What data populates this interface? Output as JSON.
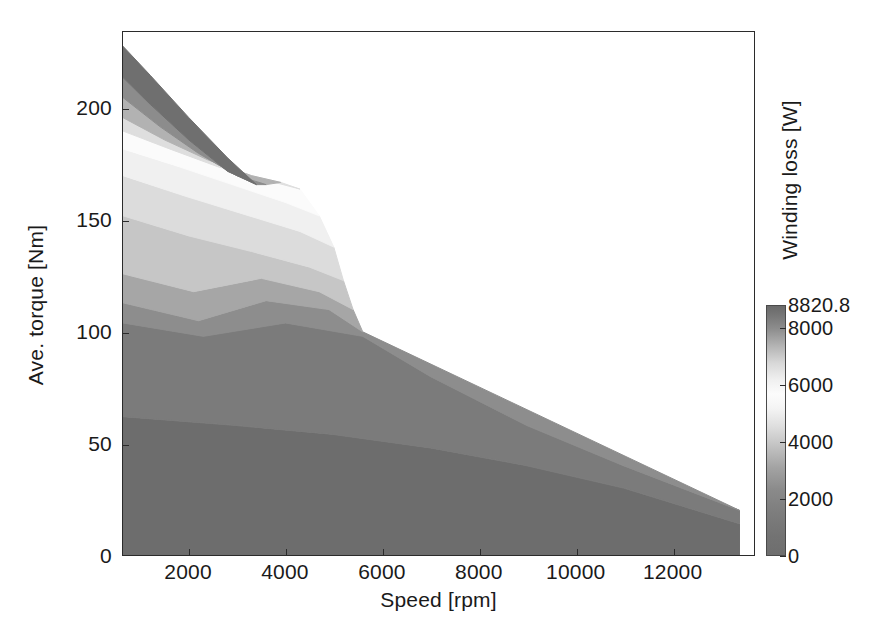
{
  "figure": {
    "background": "#ffffff",
    "plot_bg": "#ffffff",
    "frame_color": "#2b2b2b"
  },
  "axes": {
    "xlabel": "Speed [rpm]",
    "ylabel": "Ave. torque [Nm]",
    "xticks": [
      2000,
      4000,
      6000,
      8000,
      10000,
      12000
    ],
    "xtick_labels": [
      "2000",
      "4000",
      "6000",
      "8000",
      "10000",
      "12000"
    ],
    "yticks": [
      0,
      50,
      100,
      150,
      200
    ],
    "ytick_labels": [
      "0",
      "50",
      "100",
      "150",
      "200"
    ],
    "xlim": [
      636,
      13700
    ],
    "ylim": [
      0,
      234.4
    ],
    "grid": false
  },
  "colorbar": {
    "label": "Winding loss [W]",
    "ticks": [
      8820.8,
      8000,
      6000,
      4000,
      2000,
      0
    ],
    "tick_labels": [
      "8820.8",
      "8000",
      "6000",
      "4000",
      "2000",
      "0"
    ],
    "vmin": 0,
    "vmax": 8820.8,
    "orientation": "vertical",
    "position": "right",
    "colormap_stops": [
      {
        "value": 0,
        "color": "#6e6e6e"
      },
      {
        "value": 700,
        "color": "#737373"
      },
      {
        "value": 1500,
        "color": "#7d7d7d"
      },
      {
        "value": 2300,
        "color": "#8a8a8a"
      },
      {
        "value": 3100,
        "color": "#a3a3a3"
      },
      {
        "value": 3900,
        "color": "#c4c4c4"
      },
      {
        "value": 4600,
        "color": "#e0e0e0"
      },
      {
        "value": 5200,
        "color": "#f4f4f4"
      },
      {
        "value": 5700,
        "color": "#fcfcfc"
      },
      {
        "value": 6200,
        "color": "#f0f0f0"
      },
      {
        "value": 6800,
        "color": "#d8d8d8"
      },
      {
        "value": 7400,
        "color": "#b4b4b4"
      },
      {
        "value": 8000,
        "color": "#8e8e8e"
      },
      {
        "value": 8500,
        "color": "#767676"
      },
      {
        "value": 8820.8,
        "color": "#6a6a6a"
      }
    ]
  },
  "chart_data": {
    "type": "heatmap",
    "subtype": "filled-contour",
    "title": "",
    "xlabel": "Speed [rpm]",
    "ylabel": "Ave. torque [Nm]",
    "zlabel": "Winding loss [W]",
    "xlim": [
      636,
      13700
    ],
    "ylim": [
      0,
      234.4
    ],
    "zlim": [
      0,
      8820.8
    ],
    "grid": false,
    "legend_position": "right-colorbar",
    "envelope": {
      "name": "Peak torque envelope",
      "x": [
        636,
        1200,
        2000,
        2800,
        3500,
        4200,
        4800,
        5200,
        5600,
        6000,
        6600,
        7200,
        7800,
        8600,
        9400,
        10200,
        11000,
        11800,
        12600,
        13400
      ],
      "y": [
        228,
        215,
        196,
        178,
        163,
        146,
        127,
        112,
        99,
        92,
        80,
        71,
        62,
        55,
        48,
        42,
        37,
        32,
        26,
        20
      ]
    },
    "contour_levels": [
      0,
      700,
      1500,
      2300,
      3100,
      3900,
      4600,
      5200,
      5700,
      6200,
      6800,
      7400,
      8000,
      8500,
      8820.8
    ],
    "bands": [
      {
        "level_low": 7400,
        "level_high": 8820.8,
        "fill": "#6f6f6f",
        "note": "darkest band hugging the envelope at low speed, top-left corner",
        "upper_x": [
          636,
          1200,
          2000,
          2800,
          3400
        ],
        "upper_y": [
          228,
          215,
          196,
          178,
          166
        ],
        "lower_x": [
          636,
          1200,
          2000,
          2800,
          3400
        ],
        "lower_y": [
          214,
          202,
          186,
          172,
          166
        ]
      },
      {
        "level_low": 6800,
        "level_high": 7400,
        "fill": "#8c8c8c",
        "upper_x": [
          636,
          1200,
          2000,
          2800,
          3400
        ],
        "upper_y": [
          214,
          202,
          186,
          172,
          166
        ],
        "lower_x": [
          636,
          1400,
          2200,
          3000,
          3600
        ],
        "lower_y": [
          205,
          192,
          180,
          170,
          166
        ]
      },
      {
        "level_low": 6200,
        "level_high": 6800,
        "fill": "#b2b2b2",
        "upper_x": [
          636,
          1400,
          2200,
          3000,
          3600
        ],
        "upper_y": [
          205,
          192,
          180,
          170,
          166
        ],
        "lower_x": [
          636,
          1500,
          2400,
          3300,
          3900
        ],
        "lower_y": [
          196,
          186,
          177,
          170,
          167
        ]
      },
      {
        "level_low": 5700,
        "level_high": 6200,
        "fill": "#dedede",
        "upper_x": [
          636,
          1500,
          2400,
          3300,
          3900
        ],
        "upper_y": [
          196,
          186,
          177,
          170,
          167
        ],
        "lower_x": [
          636,
          1600,
          2600,
          3600,
          4300
        ],
        "lower_y": [
          190,
          182,
          174,
          168,
          164
        ]
      },
      {
        "level_low": 5200,
        "level_high": 5700,
        "fill": "#fbfbfb",
        "note": "lightest band (peak of grayscale) running as a pale wedge",
        "upper_x": [
          636,
          1600,
          2600,
          3600,
          4300
        ],
        "upper_y": [
          190,
          182,
          174,
          168,
          164
        ],
        "lower_x": [
          636,
          1800,
          2900,
          4000,
          4700
        ],
        "lower_y": [
          182,
          174,
          166,
          158,
          152
        ]
      },
      {
        "level_low": 4600,
        "level_high": 5200,
        "fill": "#f0f0f0",
        "upper_x": [
          636,
          1800,
          2900,
          4000,
          4700
        ],
        "upper_y": [
          182,
          174,
          166,
          158,
          152
        ],
        "lower_x": [
          636,
          1900,
          3100,
          4300,
          5000
        ],
        "lower_y": [
          170,
          161,
          153,
          145,
          138
        ]
      },
      {
        "level_low": 3900,
        "level_high": 4600,
        "fill": "#dcdcdc",
        "upper_x": [
          636,
          1900,
          3100,
          4300,
          5000
        ],
        "upper_y": [
          170,
          161,
          153,
          145,
          138
        ],
        "lower_x": [
          636,
          2000,
          3300,
          4500,
          5200
        ],
        "lower_y": [
          152,
          143,
          136,
          129,
          123
        ]
      },
      {
        "level_low": 3100,
        "level_high": 3900,
        "fill": "#c6c6c6",
        "upper_x": [
          636,
          2000,
          3300,
          4500,
          5200
        ],
        "upper_y": [
          152,
          143,
          136,
          129,
          123
        ],
        "lower_x": [
          636,
          2100,
          3500,
          4700,
          5400
        ],
        "lower_y": [
          126,
          118,
          124,
          118,
          110
        ]
      },
      {
        "level_low": 2300,
        "level_high": 3100,
        "fill": "#a6a6a6",
        "note": "chevron band with a pronounced valley near 2200 rpm",
        "upper_x": [
          636,
          2100,
          3500,
          4700,
          5400
        ],
        "upper_y": [
          126,
          118,
          124,
          118,
          110
        ],
        "lower_x": [
          636,
          2200,
          3600,
          4900,
          5600
        ],
        "lower_y": [
          113,
          105,
          114,
          110,
          100
        ]
      },
      {
        "level_low": 1500,
        "level_high": 2300,
        "fill": "#8d8d8d",
        "upper_x": [
          636,
          2200,
          3600,
          4900,
          5600
        ],
        "upper_y": [
          113,
          105,
          114,
          110,
          100
        ],
        "lower_x": [
          636,
          2300,
          4000,
          5600,
          7000,
          9000,
          11000,
          13400
        ],
        "lower_y": [
          104,
          98,
          104,
          98,
          80,
          58,
          40,
          20
        ]
      },
      {
        "level_low": 700,
        "level_high": 1500,
        "fill": "#7b7b7b",
        "note": "broad mid-gray region filling the bulk of the envelope",
        "upper_x": [
          636,
          2300,
          4000,
          5600,
          7000,
          9000,
          11000,
          13400
        ],
        "upper_y": [
          104,
          98,
          104,
          98,
          80,
          58,
          40,
          20
        ],
        "lower_x": [
          636,
          3000,
          5000,
          7000,
          9000,
          11000,
          13400
        ],
        "lower_y": [
          62,
          58,
          54,
          48,
          40,
          30,
          14
        ]
      },
      {
        "level_low": 0,
        "level_high": 700,
        "fill": "#6d6d6d",
        "note": "darkest low-loss band along the zero-torque axis",
        "upper_x": [
          636,
          3000,
          5000,
          7000,
          9000,
          11000,
          13400
        ],
        "upper_y": [
          62,
          58,
          54,
          48,
          40,
          30,
          14
        ],
        "lower_x": [
          636,
          13400
        ],
        "lower_y": [
          0,
          0
        ]
      }
    ]
  }
}
